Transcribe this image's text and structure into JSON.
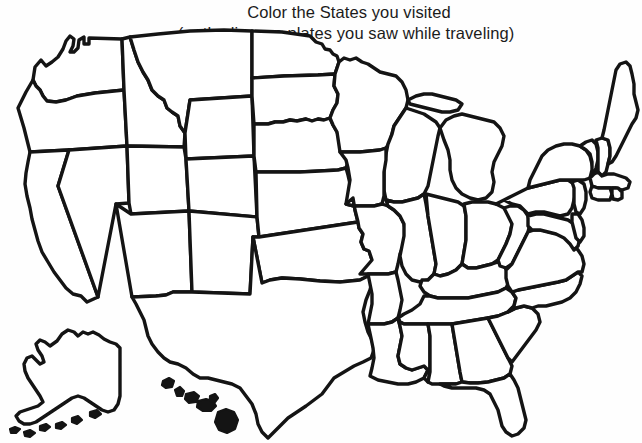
{
  "page": {
    "width": 642,
    "height": 443,
    "background_color": "#fefefe",
    "ink_color": "#141414"
  },
  "title": {
    "line1": "Color the States you visited",
    "line2": "(or the license plates you saw while traveling)"
  },
  "map": {
    "name": "united-states-outline-map",
    "style": "blank coloring-page outline, thick hand-drawn black borders, white fill",
    "includes_insets": true,
    "inset_names": [
      "Alaska",
      "Hawaii"
    ],
    "regions": [
      {
        "name": "Washington"
      },
      {
        "name": "Oregon"
      },
      {
        "name": "California"
      },
      {
        "name": "Nevada"
      },
      {
        "name": "Idaho"
      },
      {
        "name": "Montana"
      },
      {
        "name": "Wyoming"
      },
      {
        "name": "Utah"
      },
      {
        "name": "Arizona"
      },
      {
        "name": "Colorado"
      },
      {
        "name": "New Mexico"
      },
      {
        "name": "North Dakota"
      },
      {
        "name": "South Dakota"
      },
      {
        "name": "Nebraska"
      },
      {
        "name": "Kansas"
      },
      {
        "name": "Oklahoma"
      },
      {
        "name": "Texas"
      },
      {
        "name": "Minnesota"
      },
      {
        "name": "Iowa"
      },
      {
        "name": "Missouri"
      },
      {
        "name": "Arkansas"
      },
      {
        "name": "Louisiana"
      },
      {
        "name": "Wisconsin"
      },
      {
        "name": "Illinois"
      },
      {
        "name": "Michigan"
      },
      {
        "name": "Indiana"
      },
      {
        "name": "Ohio"
      },
      {
        "name": "Kentucky"
      },
      {
        "name": "Tennessee"
      },
      {
        "name": "Mississippi"
      },
      {
        "name": "Alabama"
      },
      {
        "name": "Georgia"
      },
      {
        "name": "Florida"
      },
      {
        "name": "South Carolina"
      },
      {
        "name": "North Carolina"
      },
      {
        "name": "Virginia"
      },
      {
        "name": "West Virginia"
      },
      {
        "name": "Maryland"
      },
      {
        "name": "Delaware"
      },
      {
        "name": "Pennsylvania"
      },
      {
        "name": "New Jersey"
      },
      {
        "name": "New York"
      },
      {
        "name": "Connecticut"
      },
      {
        "name": "Rhode Island"
      },
      {
        "name": "Massachusetts"
      },
      {
        "name": "Vermont"
      },
      {
        "name": "New Hampshire"
      },
      {
        "name": "Maine"
      },
      {
        "name": "Alaska"
      },
      {
        "name": "Hawaii"
      }
    ]
  }
}
